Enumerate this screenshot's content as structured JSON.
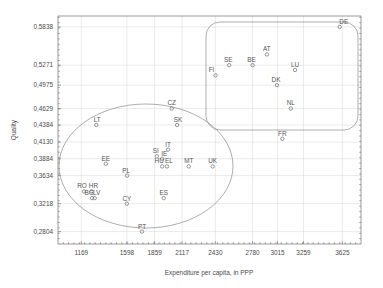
{
  "chart_data": {
    "type": "scatter",
    "title": "",
    "xlabel": "Expenditure per capita, in PPP",
    "ylabel": "Quality",
    "xlim": [
      950,
      3800
    ],
    "ylim": [
      0.262,
      0.6
    ],
    "grid": true,
    "legend": "none",
    "xticks": [
      1169,
      1598,
      1859,
      2117,
      2430,
      2780,
      3015,
      3259,
      3625
    ],
    "xtick_labels": [
      "1169",
      "1598",
      "1859",
      "2117",
      "2430",
      "2780",
      "3015",
      "3259",
      "3625"
    ],
    "yticks": [
      0.2804,
      0.3218,
      0.3634,
      0.3884,
      0.413,
      0.4384,
      0.4629,
      0.4975,
      0.5271,
      0.5838
    ],
    "ytick_labels": [
      "0,2804",
      "0,3218",
      "0,3634",
      "0,3884",
      "0,4130",
      "0,4384",
      "0,4629",
      "0,4975",
      "0,5271",
      "0,5838"
    ],
    "points": [
      {
        "label": "DE",
        "x": 3600,
        "y": 0.5838,
        "label_dx": 4,
        "label_dy": -3
      },
      {
        "label": "AT",
        "x": 2915,
        "y": 0.543,
        "label_dx": 0,
        "label_dy": -3
      },
      {
        "label": "SE",
        "x": 2560,
        "y": 0.5271,
        "label_dx": -1,
        "label_dy": -3
      },
      {
        "label": "BE",
        "x": 2780,
        "y": 0.5271,
        "label_dx": -1,
        "label_dy": -3
      },
      {
        "label": "LU",
        "x": 3180,
        "y": 0.52,
        "label_dx": 0,
        "label_dy": -3
      },
      {
        "label": "FI",
        "x": 2432,
        "y": 0.512,
        "label_dx": -4,
        "label_dy": -3
      },
      {
        "label": "DK",
        "x": 3010,
        "y": 0.4975,
        "label_dx": -1,
        "label_dy": -3
      },
      {
        "label": "NL",
        "x": 3140,
        "y": 0.4629,
        "label_dx": 0,
        "label_dy": -3
      },
      {
        "label": "FR",
        "x": 3060,
        "y": 0.418,
        "label_dx": 0,
        "label_dy": -3
      },
      {
        "label": "CZ",
        "x": 2020,
        "y": 0.4629,
        "label_dx": 0,
        "label_dy": -3
      },
      {
        "label": "SK",
        "x": 2070,
        "y": 0.4384,
        "label_dx": 1,
        "label_dy": -3
      },
      {
        "label": "LT",
        "x": 1310,
        "y": 0.4384,
        "label_dx": 1,
        "label_dy": -3
      },
      {
        "label": "IT",
        "x": 1985,
        "y": 0.402,
        "label_dx": 0,
        "label_dy": -3
      },
      {
        "label": "SI",
        "x": 1880,
        "y": 0.392,
        "label_dx": -1,
        "label_dy": -3
      },
      {
        "label": "IE",
        "x": 1930,
        "y": 0.3884,
        "label_dx": 2,
        "label_dy": -3
      },
      {
        "label": "HU",
        "x": 1930,
        "y": 0.377,
        "label_dx": -3,
        "label_dy": -3
      },
      {
        "label": "EL",
        "x": 1975,
        "y": 0.377,
        "label_dx": 2,
        "label_dy": -3
      },
      {
        "label": "MT",
        "x": 2180,
        "y": 0.377,
        "label_dx": 0,
        "label_dy": -3
      },
      {
        "label": "UK",
        "x": 2405,
        "y": 0.377,
        "label_dx": 0,
        "label_dy": -3
      },
      {
        "label": "EE",
        "x": 1400,
        "y": 0.381,
        "label_dx": 0,
        "label_dy": -3
      },
      {
        "label": "PL",
        "x": 1600,
        "y": 0.3634,
        "label_dx": -1,
        "label_dy": -3
      },
      {
        "label": "RO",
        "x": 1195,
        "y": 0.34,
        "label_dx": -2,
        "label_dy": -3
      },
      {
        "label": "HR",
        "x": 1265,
        "y": 0.34,
        "label_dx": 2,
        "label_dy": -3
      },
      {
        "label": "BG",
        "x": 1270,
        "y": 0.33,
        "label_dx": -3,
        "label_dy": -3
      },
      {
        "label": "LV",
        "x": 1295,
        "y": 0.33,
        "label_dx": 2,
        "label_dy": -3
      },
      {
        "label": "CY",
        "x": 1598,
        "y": 0.3218,
        "label_dx": 0,
        "label_dy": -3
      },
      {
        "label": "ES",
        "x": 1945,
        "y": 0.33,
        "label_dx": 0,
        "label_dy": -3
      },
      {
        "label": "PT",
        "x": 1740,
        "y": 0.2804,
        "label_dx": 0,
        "label_dy": -3
      }
    ],
    "annotations": [
      {
        "shape": "ellipse",
        "name": "low-expenditure-cluster"
      },
      {
        "shape": "rounded-rect",
        "name": "high-expenditure-cluster"
      }
    ]
  }
}
